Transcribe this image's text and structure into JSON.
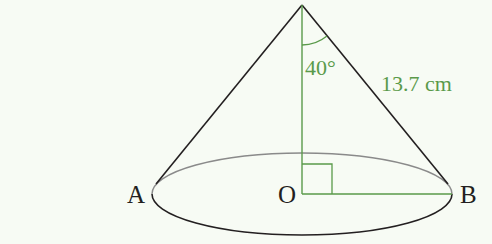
{
  "diagram": {
    "type": "right circular cone",
    "colors": {
      "background": "#f7fbf4",
      "outline": "#231f20",
      "ellipse_back": "#7a7a7a",
      "annotation": "#5a9a4a"
    },
    "points": {
      "apex": "",
      "A": "A",
      "O": "O",
      "B": "B"
    },
    "labels": {
      "angle": "40°",
      "slant_height": "13.7 cm"
    },
    "geometry": {
      "apex": [
        302,
        5
      ],
      "base_center": [
        302,
        194
      ],
      "base_rx": 150,
      "base_ry": 41,
      "left_tangent": [
        158,
        182
      ],
      "right_tangent": [
        446,
        182
      ],
      "right_angle_marker": true,
      "angle_arc_radius": 40
    }
  }
}
